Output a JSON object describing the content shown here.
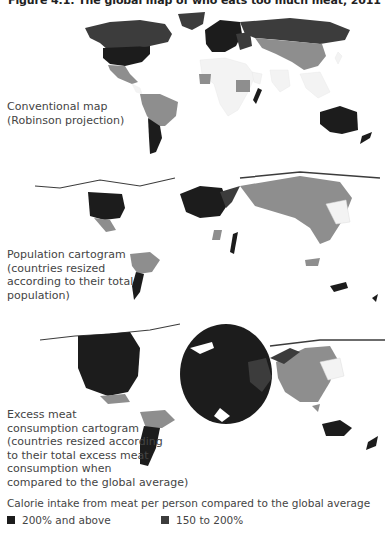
{
  "figure": {
    "title": "Figure 4.1: The global map of who eats too much meat, 2011"
  },
  "colors": {
    "tier_200_above": "#1c1c1c",
    "tier_150_200": "#3c3c3c",
    "tier_lower": "#8e8e8e",
    "tier_below": "#f3f3f3",
    "background": "#ffffff"
  },
  "maps": [
    {
      "id": "conventional",
      "label_lines": [
        "Conventional map",
        "(Robinson projection)"
      ]
    },
    {
      "id": "population",
      "label_lines": [
        "Population cartogram",
        "(countries resized",
        "according to their total",
        "population)"
      ]
    },
    {
      "id": "excess",
      "label_lines": [
        "Excess meat",
        "consumption cartogram",
        "(countries resized according",
        "to their total excess meat",
        "consumption when",
        "compared to the global average)"
      ]
    }
  ],
  "legend": {
    "title": "Calorie intake from meat per person compared to the global average",
    "items": [
      {
        "label": "200% and above",
        "color": "#1c1c1c"
      },
      {
        "label": "150 to 200%",
        "color": "#3c3c3c"
      }
    ]
  }
}
